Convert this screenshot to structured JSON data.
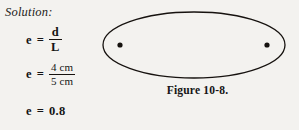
{
  "page": {
    "background_color": "#f3f2ef",
    "ink_color": "#151515"
  },
  "solution": {
    "heading": "Solution:",
    "equations": [
      {
        "id": "ratio",
        "lhs": "e",
        "relation": "=",
        "numerator": "d",
        "denominator": "L"
      },
      {
        "id": "values",
        "lhs": "e",
        "relation": "=",
        "numerator": "4 cm",
        "denominator": "5 cm"
      },
      {
        "id": "result",
        "lhs": "e",
        "relation": "=",
        "value": "0.8"
      }
    ]
  },
  "figure": {
    "caption": "Figure 10-8.",
    "shape": "ellipse",
    "stroke_color": "#16120f",
    "fill_color": "none",
    "center_x": 98,
    "center_y": 45,
    "radius_x": 91,
    "radius_y": 33,
    "foci": [
      {
        "name": "left-focus",
        "x": 24,
        "y": 45,
        "r": 2.6
      },
      {
        "name": "right-focus",
        "x": 171,
        "y": 45,
        "r": 2.6
      }
    ]
  }
}
